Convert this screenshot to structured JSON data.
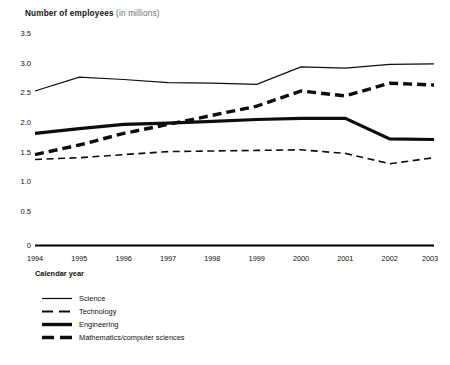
{
  "title": {
    "main": "Number of employees",
    "sub": "(in millions)"
  },
  "axes": {
    "x_title": "Calendar year",
    "y_ticks": [
      "3.5",
      "3.0",
      "2.5",
      "2.0",
      "1.5",
      "1.0",
      "0.5",
      "0"
    ],
    "x_ticks": [
      "1994",
      "1995",
      "1996",
      "1997",
      "1998",
      "1999",
      "2000",
      "2001",
      "2002",
      "2003"
    ]
  },
  "legend": {
    "items": [
      {
        "label": "Science",
        "style": "thin-solid"
      },
      {
        "label": "Technology",
        "style": "thin-dashed"
      },
      {
        "label": "Engineering",
        "style": "thick-solid"
      },
      {
        "label": "Mathematics/computer sciences",
        "style": "thick-dashed"
      }
    ]
  },
  "colors": {
    "ink": "#0d0d0d",
    "muted": "#6d6d6d",
    "background": "#ffffff"
  },
  "chart_data": {
    "type": "line",
    "title": "Number of employees (in millions)",
    "xlabel": "Calendar year",
    "ylabel": "Number of employees (in millions)",
    "x": [
      1994,
      1995,
      1996,
      1997,
      1998,
      1999,
      2000,
      2001,
      2002,
      2003
    ],
    "categories": [
      "1994",
      "1995",
      "1996",
      "1997",
      "1998",
      "1999",
      "2000",
      "2001",
      "2002",
      "2003"
    ],
    "ylim": [
      0,
      3.5
    ],
    "yticks": [
      0,
      0.5,
      1.0,
      1.5,
      2.0,
      2.5,
      3.0,
      3.5
    ],
    "grid": false,
    "legend_position": "below-left",
    "series": [
      {
        "name": "Science",
        "style": "thin-solid",
        "values": [
          2.55,
          2.78,
          2.74,
          2.69,
          2.68,
          2.66,
          2.95,
          2.93,
          2.99,
          3.0
        ]
      },
      {
        "name": "Technology",
        "style": "thin-dashed",
        "values": [
          1.42,
          1.45,
          1.5,
          1.55,
          1.56,
          1.57,
          1.58,
          1.52,
          1.35,
          1.45
        ]
      },
      {
        "name": "Engineering",
        "style": "thick-solid",
        "values": [
          1.85,
          1.93,
          2.0,
          2.02,
          2.05,
          2.08,
          2.1,
          2.1,
          1.76,
          1.75
        ]
      },
      {
        "name": "Mathematics/computer sciences",
        "style": "thick-dashed",
        "values": [
          1.5,
          1.66,
          1.85,
          2.0,
          2.15,
          2.3,
          2.55,
          2.47,
          2.68,
          2.65
        ]
      }
    ]
  }
}
